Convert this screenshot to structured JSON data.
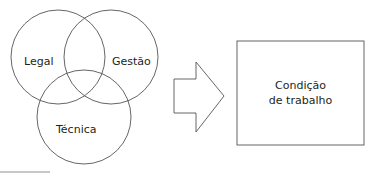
{
  "venn": {
    "circles": [
      {
        "label": "Legal"
      },
      {
        "label": "Gestão"
      },
      {
        "label": "Técnica"
      }
    ]
  },
  "arrow": {
    "direction": "right"
  },
  "result_box": {
    "line1": "Condição",
    "line2": "de trabalho"
  },
  "colors": {
    "stroke": "#4d4d4d",
    "text": "#231f20",
    "background": "#ffffff"
  }
}
